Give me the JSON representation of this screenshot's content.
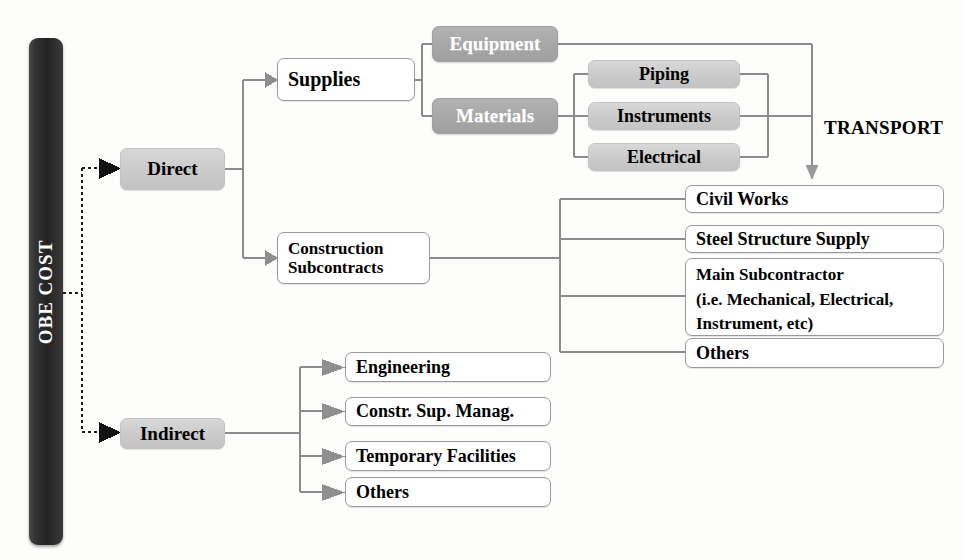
{
  "diagram": {
    "root": {
      "label": "OBE COST"
    },
    "annotations": [
      {
        "id": "transport",
        "label": "TRANSPORT"
      }
    ],
    "branches": [
      {
        "id": "direct",
        "label": "Direct",
        "style": "light-gray",
        "children": [
          {
            "id": "supplies",
            "label": "Supplies",
            "style": "white",
            "children": [
              {
                "id": "equipment",
                "label": "Equipment",
                "style": "medium-gray",
                "children": []
              },
              {
                "id": "materials",
                "label": "Materials",
                "style": "medium-gray",
                "children": [
                  {
                    "id": "piping",
                    "label": "Piping",
                    "style": "light-gray"
                  },
                  {
                    "id": "instruments",
                    "label": "Instruments",
                    "style": "light-gray"
                  },
                  {
                    "id": "electrical",
                    "label": "Electrical",
                    "style": "light-gray"
                  }
                ]
              }
            ]
          },
          {
            "id": "construction-subcontracts",
            "label": "Construction\nSubcontracts",
            "label_line1": "Construction",
            "label_line2": "Subcontracts",
            "style": "white",
            "children": [
              {
                "id": "civil-works",
                "label": "Civil Works",
                "style": "white"
              },
              {
                "id": "steel-structure-supply",
                "label": "Steel Structure Supply",
                "style": "white"
              },
              {
                "id": "main-subcontractor",
                "label": "Main Subcontractor (i.e. Mechanical, Electrical, Instrument, etc)",
                "label_line1": "Main Subcontractor",
                "label_line2": "(i.e. Mechanical, Electrical,",
                "label_line3": "Instrument, etc)",
                "style": "white"
              },
              {
                "id": "subcontract-others",
                "label": "Others",
                "style": "white"
              }
            ]
          }
        ]
      },
      {
        "id": "indirect",
        "label": "Indirect",
        "style": "light-gray",
        "children": [
          {
            "id": "engineering",
            "label": "Engineering",
            "style": "white"
          },
          {
            "id": "constr-sup-manag",
            "label": "Constr. Sup. Manag.",
            "style": "white"
          },
          {
            "id": "temporary-facilities",
            "label": "Temporary Facilities",
            "style": "white"
          },
          {
            "id": "indirect-others",
            "label": "Others",
            "style": "white"
          }
        ]
      }
    ],
    "colors": {
      "background": "#fdfdfc",
      "root_bar": "#2b2b2b",
      "light_gray_fill": "#cfcfcf",
      "medium_gray_fill": "#a8a8a8",
      "box_border": "#9a9a9a",
      "connector": "#8c8c8c",
      "arrow_dark": "#141414",
      "arrow_gray": "#8a8a8a",
      "text": "#000000",
      "text_inverse": "#ffffff"
    }
  }
}
